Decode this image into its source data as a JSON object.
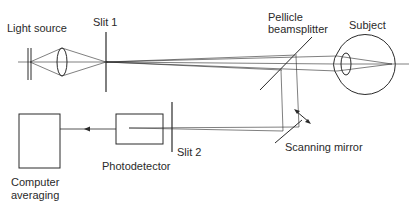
{
  "diagram": {
    "type": "optical-setup",
    "labels": {
      "light_source": "Light source",
      "slit1": "Slit 1",
      "pellicle_line1": "Pellicle",
      "pellicle_line2": "beamsplitter",
      "subject": "Subject",
      "scanning_mirror": "Scanning mirror",
      "slit2": "Slit 2",
      "photodetector": "Photodetector",
      "computer_line1": "Computer",
      "computer_line2": "averaging"
    },
    "colors": {
      "line": "#2a2a2a",
      "background": "#ffffff"
    }
  }
}
